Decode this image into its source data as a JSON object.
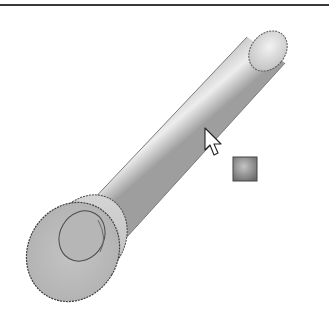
{
  "viewport": {
    "label": "3D model viewport",
    "background_color": "#ffffff"
  },
  "model": {
    "part": "pin",
    "features": [
      "cylindrical-shaft",
      "end-cap",
      "flange-head",
      "flange-recess"
    ],
    "shaft_color_light": "#e6e6e6",
    "shaft_color_dark": "#9a9a9a",
    "edge_color": "#4a4a4a"
  },
  "pointer": {
    "icon": "arrow-cursor-icon",
    "hover_target": "cylindrical-shaft"
  },
  "selection_feedback": {
    "icon": "face-filter-icon",
    "fill_light": "#b8b8b8",
    "fill_dark": "#6e6e6e"
  }
}
